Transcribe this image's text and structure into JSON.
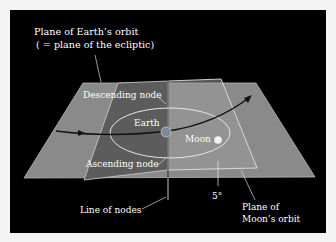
{
  "diagram": {
    "title_label": {
      "line1": "Plane of Earth’s orbit",
      "line2": "( = plane of the ecliptic)"
    },
    "labels": {
      "descending_node": "Descending node",
      "ascending_node": "Ascending node",
      "earth": "Earth",
      "moon": "Moon",
      "line_of_nodes": "Line of nodes",
      "angle": "5°",
      "moon_plane_line1": "Plane of",
      "moon_plane_line2": "Moon’s orbit"
    },
    "colors": {
      "background": "#000000",
      "page": "#f4f4f4",
      "ecliptic_plane": "#8a8a8a",
      "moon_plane_dark": "#5a5a5a",
      "moon_plane_light": "#9a9a9a",
      "orbit": "#e6e6e6",
      "earth_path": "#111111",
      "text": "#ffffff"
    }
  }
}
